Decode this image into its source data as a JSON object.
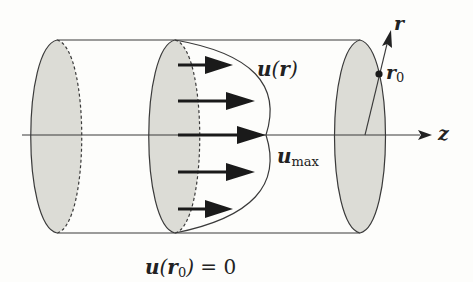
{
  "diagram": {
    "colors": {
      "stroke": "#3a3a3a",
      "disk_fill": "#dcdcd6",
      "arrow": "#1a1a1a",
      "background": "#fdfdfb"
    },
    "labels": {
      "profile": {
        "var": "u",
        "open": "(",
        "arg": "r",
        "close": ")"
      },
      "umax": {
        "var": "u",
        "sub": "max"
      },
      "r_axis": "r",
      "r0": {
        "var": "r",
        "sub": "0"
      },
      "z_axis": "z",
      "boundary_condition": {
        "var": "u",
        "open": "(",
        "arg": "r",
        "arg_sub": "0",
        "close": ")",
        "rhs": "= 0"
      }
    },
    "arrows": [
      {
        "y": 65,
        "x_start": 178,
        "x_end": 233
      },
      {
        "y": 101,
        "x_start": 178,
        "x_end": 255
      },
      {
        "y": 135,
        "x_start": 178,
        "x_end": 266
      },
      {
        "y": 172,
        "x_start": 178,
        "x_end": 255
      },
      {
        "y": 209,
        "x_start": 178,
        "x_end": 233
      }
    ],
    "cross_sections": [
      "left-disk",
      "middle-disk",
      "right-disk"
    ]
  }
}
